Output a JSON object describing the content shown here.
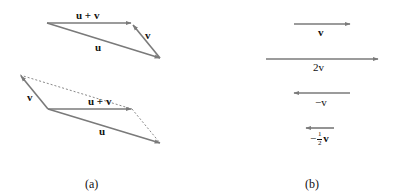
{
  "colors": {
    "arrow": "#7a7a7a",
    "dotted": "#888888",
    "text": "#111111",
    "background": "#ffffff"
  },
  "panel_a": {
    "caption": "(a)",
    "top_triangle": {
      "u_label": "u",
      "v_label": "v",
      "sum_label": "u + v"
    },
    "parallelogram": {
      "u_label": "u",
      "v_label": "v",
      "sum_label": "u + v"
    }
  },
  "panel_b": {
    "caption": "(b)",
    "vectors": [
      {
        "label": "v"
      },
      {
        "label": "2v"
      },
      {
        "label": "−v"
      },
      {
        "label_prefix": "−",
        "frac_num": "1",
        "frac_den": "2",
        "label_suffix": "v"
      }
    ]
  }
}
